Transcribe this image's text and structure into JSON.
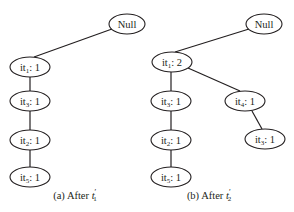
{
  "figures": [
    {
      "id": "a",
      "caption_prefix": "(a)",
      "caption_text": "After ",
      "caption_var": "t",
      "caption_sup": "′",
      "caption_sub": "1",
      "nodes": [
        {
          "key": "null",
          "text": "Null"
        },
        {
          "key": "it1",
          "base": "it",
          "sub": "1",
          "count": ": 1"
        },
        {
          "key": "it3",
          "base": "it",
          "sub": "3",
          "count": ": 1"
        },
        {
          "key": "it2",
          "base": "it",
          "sub": "2",
          "count": ": 1"
        },
        {
          "key": "it5",
          "base": "it",
          "sub": "5",
          "count": ": 1"
        }
      ]
    },
    {
      "id": "b",
      "caption_prefix": "(b)",
      "caption_text": "After ",
      "caption_var": "t",
      "caption_sup": "′",
      "caption_sub": "2",
      "nodes": [
        {
          "key": "null",
          "text": "Null"
        },
        {
          "key": "it1",
          "base": "it",
          "sub": "1",
          "count": ": 2"
        },
        {
          "key": "it3",
          "base": "it",
          "sub": "3",
          "count": ": 1"
        },
        {
          "key": "it2",
          "base": "it",
          "sub": "2",
          "count": ": 1"
        },
        {
          "key": "it5",
          "base": "it",
          "sub": "5",
          "count": ": 1"
        },
        {
          "key": "it4",
          "base": "it",
          "sub": "4",
          "count": ": 1"
        },
        {
          "key": "it3b",
          "base": "it",
          "sub": "3",
          "count": ": 1"
        }
      ]
    }
  ],
  "colors": {
    "stroke": "#231f20",
    "background": "#ffffff"
  }
}
